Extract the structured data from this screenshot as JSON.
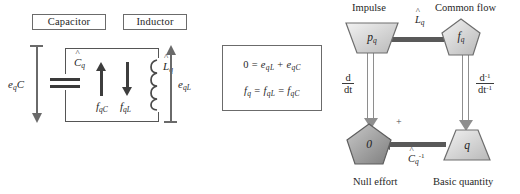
{
  "circuit": {
    "capacitor_label": "Capacitor",
    "inductor_label": "Inductor",
    "capacitance_symbol": "C",
    "capacitance_sub": "q",
    "inductance_symbol": "L",
    "inductance_sub": "q",
    "flow_cap": "f",
    "flow_cap_sub": "qC",
    "flow_ind": "f",
    "flow_ind_sub": "qL",
    "effort_cap": "e",
    "effort_cap_sub": "q",
    "effort_cap_tail": "C",
    "effort_ind": "e",
    "effort_ind_sub": "qL",
    "hat": "^"
  },
  "equations": {
    "line1": {
      "lhs": "0",
      "eq": "=",
      "term1": "e",
      "term1_sub": "qL",
      "plus": "+",
      "term2": "e",
      "term2_sub": "qC"
    },
    "line2": {
      "lhs": "f",
      "lhs_sub": "q",
      "eq1": "=",
      "mid": "f",
      "mid_sub": "qL",
      "eq2": "=",
      "rhs": "f",
      "rhs_sub": "qC"
    }
  },
  "tetrahedron": {
    "corners": {
      "top_left": "Impulse",
      "top_right": "Common flow",
      "bottom_left": "Null effort",
      "bottom_right": "Basic quantity"
    },
    "nodes": {
      "impulse": {
        "symbol": "p",
        "sub": "q",
        "shape": "trapezoid-down"
      },
      "flow": {
        "symbol": "f",
        "sub": "q",
        "shape": "pentagon"
      },
      "null_effort": {
        "symbol": "0",
        "sub": "",
        "shape": "pentagon-dark"
      },
      "quantity": {
        "symbol": "q",
        "sub": "",
        "shape": "trapezoid-up"
      }
    },
    "edges": {
      "top": {
        "symbol": "L",
        "sub": "q",
        "hat": "^"
      },
      "bottom": {
        "symbol": "C",
        "sub": "q",
        "sup": "-1",
        "hat": "^"
      },
      "left": {
        "num": "d",
        "den": "dt"
      },
      "right": {
        "num": "d",
        "num_sup": "-1",
        "den": "dt",
        "den_sup": "-1"
      }
    },
    "plus_sign": "+"
  },
  "colors": {
    "stroke": "#555555",
    "arrow_dark": "#3d3d3d",
    "arrow_gray": "#8e8e8e",
    "arrow_solid": "#595959",
    "node_fill_light": "#d9d9d9",
    "node_fill_dark": "#8a8a8a",
    "text": "#262626"
  }
}
